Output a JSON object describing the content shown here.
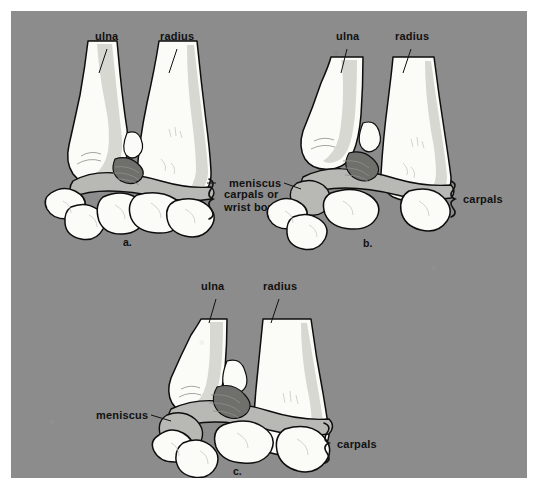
{
  "figure": {
    "background_color": "#8c8c8c",
    "page_color": "#ffffff",
    "bone_fill_color": "#fbfbf8",
    "meniscus_fill_color": "#b8b8b4",
    "outline_color": "#0d0d0d"
  },
  "panels": [
    {
      "id": "a",
      "letter": "a.",
      "labels": {
        "ulna": "ulna",
        "radius": "radius",
        "carpals": "carpals or\nwrist bones",
        "carpals_line1": "carpals or",
        "carpals_line2": "wrist bones"
      }
    },
    {
      "id": "b",
      "letter": "b.",
      "labels": {
        "ulna": "ulna",
        "radius": "radius",
        "meniscus": "meniscus",
        "carpals": "carpals"
      }
    },
    {
      "id": "c",
      "letter": "c.",
      "labels": {
        "ulna": "ulna",
        "radius": "radius",
        "meniscus": "meniscus",
        "carpals": "carpals"
      }
    }
  ]
}
